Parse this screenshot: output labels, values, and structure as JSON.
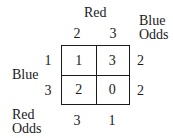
{
  "labels": {
    "column_player": "Red",
    "row_player": "Blue",
    "blue_odds": [
      "Blue",
      "Odds"
    ],
    "red_odds": [
      "Red",
      "Odds"
    ]
  },
  "column_strategies": [
    "2",
    "3"
  ],
  "row_strategies": [
    "1",
    "3"
  ],
  "payoffs": [
    [
      "1",
      "3"
    ],
    [
      "2",
      "0"
    ]
  ],
  "blue_odds_values": [
    "2",
    "2"
  ],
  "red_odds_values": [
    "3",
    "1"
  ]
}
